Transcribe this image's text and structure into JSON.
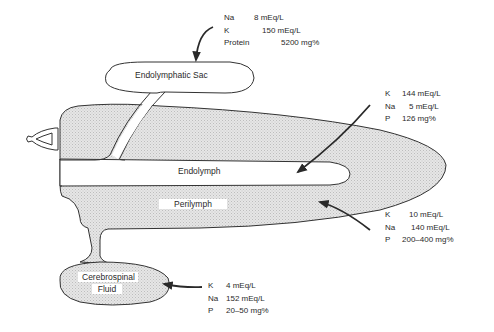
{
  "diagram": {
    "regions": {
      "endolymphatic_sac": "Endolymphatic Sac",
      "endolymph": "Endolymph",
      "perilymph": "Perilymph",
      "csf_line1": "Cerebrospinal",
      "csf_line2": "Fluid"
    },
    "compositions": {
      "endolymphatic_sac": [
        {
          "ion": "Na",
          "value": "8 mEq/L"
        },
        {
          "ion": "K",
          "value": "150 mEq/L"
        },
        {
          "ion": "Protein",
          "value": "5200 mg%"
        }
      ],
      "endolymph": [
        {
          "ion": "K",
          "value": "144 mEq/L"
        },
        {
          "ion": "Na",
          "value": "5 mEq/L"
        },
        {
          "ion": "P",
          "value": "126 mg%"
        }
      ],
      "perilymph": [
        {
          "ion": "K",
          "value": "10 mEq/L"
        },
        {
          "ion": "Na",
          "value": "140 mEq/L"
        },
        {
          "ion": "P",
          "value": "200–400 mg%"
        }
      ],
      "cerebrospinal_fluid": [
        {
          "ion": "K",
          "value": "4 mEq/L"
        },
        {
          "ion": "Na",
          "value": "152 mEq/L"
        },
        {
          "ion": "P",
          "value": "20–50 mg%"
        }
      ]
    },
    "colors": {
      "stroke": "#333333",
      "fill_stipple": "#dcdcdc",
      "background": "#ffffff"
    }
  }
}
